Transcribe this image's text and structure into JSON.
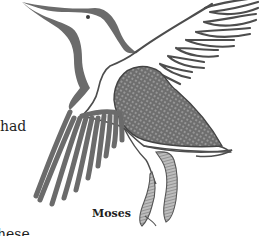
{
  "page": {
    "body_text_fragments": [
      "had",
      "hese"
    ],
    "caption": "Moses",
    "illustration": {
      "subject": "bird-in-flight",
      "ink_color": "#6b6b6b",
      "outline_color": "#4a4a4a",
      "background": "#ffffff"
    }
  }
}
